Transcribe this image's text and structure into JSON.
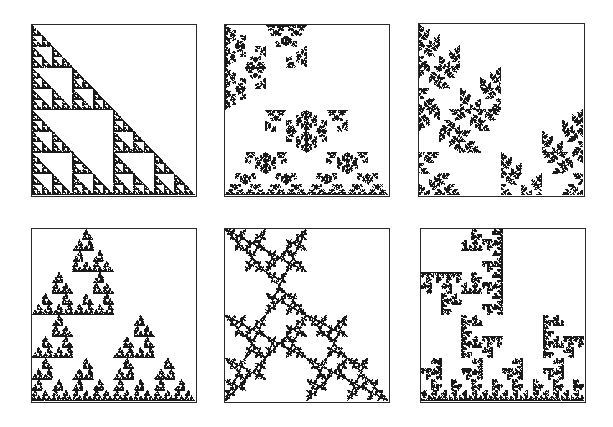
{
  "figure": {
    "ink_color": "#1a1a1a",
    "frame_color": "#2a2a2a",
    "background": "#ffffff"
  },
  "panels": [
    {
      "id": 1,
      "row": 1,
      "col": 1,
      "motif": "snowflake-rings",
      "box": [
        31,
        24,
        166,
        173
      ],
      "maps": [
        [
          0,
          0,
          0
        ],
        [
          0,
          1,
          0
        ],
        [
          1,
          1,
          0
        ]
      ],
      "rot": [
        0,
        0,
        0
      ],
      "flip": [
        0,
        0,
        0
      ]
    },
    {
      "id": 2,
      "row": 1,
      "col": 2,
      "motif": "irregular-rings",
      "box": [
        224,
        24,
        166,
        173
      ],
      "maps": [
        [
          0,
          0,
          0
        ],
        [
          0,
          1,
          0
        ],
        [
          1,
          1,
          0
        ]
      ],
      "rot": [
        1,
        0,
        0
      ],
      "flip": [
        0,
        1,
        0
      ]
    },
    {
      "id": 3,
      "row": 1,
      "col": 3,
      "motif": "diagonal-cross-lattice",
      "box": [
        418,
        23,
        167,
        174
      ],
      "maps": [
        [
          0,
          0,
          0
        ],
        [
          0,
          1,
          0
        ],
        [
          1,
          1,
          0
        ]
      ],
      "rot": [
        0,
        1,
        0
      ],
      "flip": [
        0,
        0,
        1
      ]
    },
    {
      "id": 4,
      "row": 2,
      "col": 1,
      "motif": "comb-branches",
      "box": [
        31,
        228,
        166,
        175
      ],
      "maps": [
        [
          0,
          0,
          0
        ],
        [
          0,
          1,
          0
        ],
        [
          1,
          1,
          0
        ]
      ],
      "rot": [
        0,
        0,
        0
      ],
      "flip": [
        1,
        0,
        0
      ]
    },
    {
      "id": 5,
      "row": 2,
      "col": 2,
      "motif": "triangle-chains",
      "box": [
        224,
        228,
        166,
        175
      ],
      "maps": [
        [
          0,
          0,
          0
        ],
        [
          0,
          1,
          0
        ],
        [
          1,
          1,
          0
        ]
      ],
      "rot": [
        2,
        1,
        0
      ],
      "flip": [
        0,
        0,
        0
      ]
    },
    {
      "id": 6,
      "row": 2,
      "col": 3,
      "motif": "dragon-curl-branches",
      "box": [
        420,
        228,
        166,
        175
      ],
      "maps": [
        [
          0,
          0,
          0
        ],
        [
          0,
          1,
          0
        ],
        [
          1,
          1,
          0
        ]
      ],
      "rot": [
        3,
        0,
        0
      ],
      "flip": [
        0,
        1,
        1
      ]
    }
  ]
}
